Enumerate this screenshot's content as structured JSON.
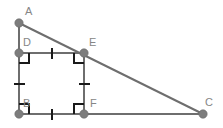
{
  "figure": {
    "background_color": "#ffffff",
    "line_color": "#6e6e6e",
    "mark_color": "#1a1a1a",
    "dot_color": "#7d7d7d",
    "label_color": "#868686"
  },
  "points": [
    {
      "id": "A",
      "label": "A",
      "x": 19,
      "y": 23,
      "label_x": 25,
      "label_y": 15
    },
    {
      "id": "D",
      "label": "D",
      "x": 19,
      "y": 53,
      "label_x": 23,
      "label_y": 46
    },
    {
      "id": "E",
      "label": "E",
      "x": 84,
      "y": 53,
      "label_x": 89,
      "label_y": 46
    },
    {
      "id": "B",
      "label": "B",
      "x": 19,
      "y": 114,
      "label_x": 23,
      "label_y": 107
    },
    {
      "id": "F",
      "label": "F",
      "x": 84,
      "y": 114,
      "label_x": 90,
      "label_y": 107
    },
    {
      "id": "C",
      "label": "C",
      "x": 203,
      "y": 114,
      "label_x": 205,
      "label_y": 106
    }
  ],
  "segments": [
    {
      "name": "segment-AB",
      "from": "A",
      "to": "B",
      "x1": 19,
      "y1": 23,
      "x2": 19,
      "y2": 114
    },
    {
      "name": "segment-AC",
      "from": "A",
      "to": "C",
      "x1": 19,
      "y1": 23,
      "x2": 203,
      "y2": 114
    },
    {
      "name": "segment-BC",
      "from": "B",
      "to": "C",
      "x1": 19,
      "y1": 114,
      "x2": 203,
      "y2": 114
    },
    {
      "name": "segment-DE",
      "from": "D",
      "to": "E",
      "x1": 19,
      "y1": 53,
      "x2": 84,
      "y2": 53
    },
    {
      "name": "segment-EF",
      "from": "E",
      "to": "F",
      "x1": 84,
      "y1": 53,
      "x2": 84,
      "y2": 114
    },
    {
      "name": "segment-DB",
      "from": "D",
      "to": "B",
      "x1": 19,
      "y1": 53,
      "x2": 19,
      "y2": 114
    }
  ],
  "tick_marks": [
    {
      "name": "tick-DE",
      "on": "DE",
      "count": 1,
      "x1": 52,
      "y1": 48,
      "x2": 52,
      "y2": 59
    },
    {
      "name": "tick-BF",
      "on": "BF",
      "count": 1,
      "x1": 52,
      "y1": 109,
      "x2": 52,
      "y2": 120
    },
    {
      "name": "tick-DB",
      "on": "DB",
      "count": 1,
      "x1": 14,
      "y1": 84,
      "x2": 25,
      "y2": 84
    },
    {
      "name": "tick-EF",
      "on": "EF",
      "count": 1,
      "x1": 79,
      "y1": 84,
      "x2": 90,
      "y2": 84
    }
  ],
  "right_angles": [
    {
      "name": "right-angle-D",
      "vertex": "D",
      "path": "M 19 63 L 29 63 L 29 53"
    },
    {
      "name": "right-angle-E",
      "vertex": "E",
      "path": "M 74 53 L 74 63 L 84 63"
    },
    {
      "name": "right-angle-B",
      "vertex": "B",
      "path": "M 19 104 L 29 104 L 29 114"
    },
    {
      "name": "right-angle-F",
      "vertex": "F",
      "path": "M 74 114 L 74 104 L 84 104"
    }
  ]
}
